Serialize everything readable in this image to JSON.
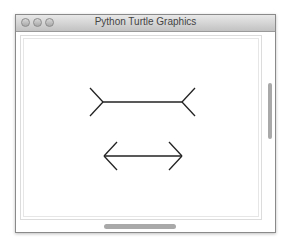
{
  "window": {
    "title": "Python Turtle Graphics",
    "buttons": [
      "close",
      "minimize",
      "zoom"
    ]
  },
  "canvas": {
    "drawings": [
      {
        "name": "outward-fins-line",
        "description": "Muller-Lyer line with outward fins"
      },
      {
        "name": "double-headed-arrow",
        "description": "Muller-Lyer line with inward arrowheads"
      }
    ],
    "stroke_color": "#222222"
  },
  "scrollbars": {
    "vertical": {
      "visible": true
    },
    "horizontal": {
      "visible": true
    }
  }
}
